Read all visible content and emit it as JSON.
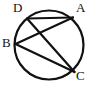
{
  "figure": {
    "type": "circle-with-inscribed-chords",
    "canvas": {
      "width": 96,
      "height": 86
    },
    "background_color": "#ffffff",
    "stroke_color": "#111111",
    "circle": {
      "name": "circle",
      "cx": 49,
      "cy": 45,
      "r": 34.5,
      "stroke_width": 2.2
    },
    "points": [
      {
        "id": "A",
        "label": "A",
        "x": 73,
        "y": 17.5,
        "label_x": 76,
        "label_y": 1
      },
      {
        "id": "B",
        "label": "B",
        "x": 15.5,
        "y": 44,
        "label_x": 2,
        "label_y": 36
      },
      {
        "id": "C",
        "label": "C",
        "x": 74.5,
        "y": 72,
        "label_x": 76,
        "label_y": 69
      },
      {
        "id": "D",
        "label": "D",
        "x": 27,
        "y": 18.5,
        "label_x": 13,
        "label_y": 1
      }
    ],
    "chords": [
      {
        "id": "DA",
        "from": "D",
        "to": "A",
        "x1": 27,
        "y1": 18.5,
        "x2": 73,
        "y2": 17.5,
        "stroke_width": 2.2
      },
      {
        "id": "DC",
        "from": "D",
        "to": "C",
        "x1": 27,
        "y1": 18.5,
        "x2": 74.5,
        "y2": 72,
        "stroke_width": 2.2
      },
      {
        "id": "BA",
        "from": "B",
        "to": "A",
        "x1": 15.5,
        "y1": 44,
        "x2": 73,
        "y2": 17.5,
        "stroke_width": 2.2
      },
      {
        "id": "BC",
        "from": "B",
        "to": "C",
        "x1": 15.5,
        "y1": 44,
        "x2": 74.5,
        "y2": 72,
        "stroke_width": 2.2
      }
    ]
  }
}
